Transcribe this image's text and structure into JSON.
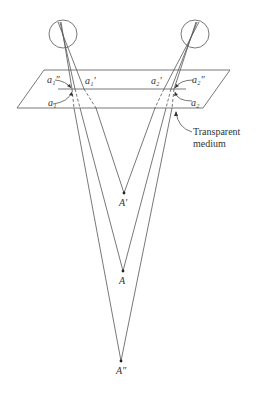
{
  "diagram": {
    "colors": {
      "line": "#555555",
      "text": "#333333",
      "background": "#ffffff"
    },
    "eyes": [
      {
        "id": "left-eye",
        "cx": 63,
        "cy": 34,
        "r": 14
      },
      {
        "id": "right-eye",
        "cx": 195,
        "cy": 34,
        "r": 14
      }
    ],
    "plane": {
      "label_line1": "Transparent",
      "label_line2": "medium"
    },
    "image_labels": {
      "a1_double_prime": "a₁″",
      "a1_prime": "a₁′",
      "a1": "a₁",
      "a2_prime": "a₂′",
      "a2_double_prime": "a₂″",
      "a2": "a₂"
    },
    "points": {
      "A_prime": {
        "label": "A′",
        "x": 124,
        "y": 193
      },
      "A": {
        "label": "A",
        "x": 123,
        "y": 271
      },
      "A_double_prime": {
        "label": "A″",
        "x": 121,
        "y": 361
      }
    }
  }
}
